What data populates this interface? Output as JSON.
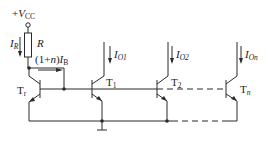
{
  "diagram": {
    "type": "multi-output current mirror circuit",
    "supply": {
      "plus": "+",
      "symbol": "V",
      "sub": "CC"
    },
    "resistor": {
      "label": "R"
    },
    "reference_current": {
      "symbol": "I",
      "sub": "R"
    },
    "base_current": {
      "prefix": "(1+",
      "n": "n",
      "suffix": ")",
      "symbol": "I",
      "sub": "B"
    },
    "transistors": [
      {
        "symbol": "T",
        "sub": "r"
      },
      {
        "symbol": "T",
        "sub": "1"
      },
      {
        "symbol": "T",
        "sub": "2"
      },
      {
        "symbol": "T",
        "sub": "n"
      }
    ],
    "output_currents": [
      {
        "symbol": "I",
        "sub": "O1"
      },
      {
        "symbol": "I",
        "sub": "O2"
      },
      {
        "symbol": "I",
        "sub": "On"
      }
    ],
    "colors": {
      "line": "#2a2a2a",
      "background": "#ffffff"
    }
  }
}
